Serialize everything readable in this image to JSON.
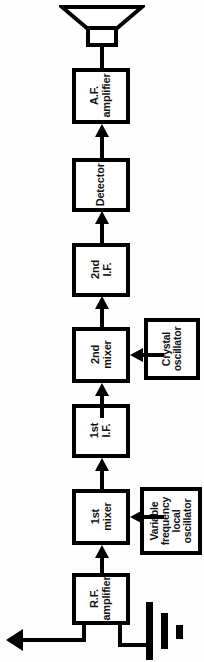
{
  "diagram": {
    "orientation": "rotated-90-ccw",
    "signal_flow": "antenna -> R.F. amplifier -> 1st mixer -> 1st I.F. -> 2nd mixer -> 2nd I.F. -> Detector -> A.F. amplifier -> loudspeaker",
    "colors": {
      "line": "#000000",
      "background": "#ffffff",
      "box_fill": "#ffffff"
    },
    "blocks": [
      {
        "id": "af-amplifier",
        "label": "A.F.\namplifier"
      },
      {
        "id": "detector",
        "label": "Detector"
      },
      {
        "id": "second-if",
        "label": "2nd\nI.F."
      },
      {
        "id": "second-mixer",
        "label": "2nd\nmixer"
      },
      {
        "id": "crystal-oscillator",
        "label": "Crystal\noscillator"
      },
      {
        "id": "first-if",
        "label": "1st\nI.F."
      },
      {
        "id": "first-mixer",
        "label": "1st\nmixer"
      },
      {
        "id": "vfo",
        "label": "Variable\nfrequency\nlocal\noscillator"
      },
      {
        "id": "rf-amplifier",
        "label": "R.F.\namplifier"
      }
    ],
    "symbols": [
      {
        "id": "loudspeaker",
        "name": "loudspeaker-symbol"
      },
      {
        "id": "antenna",
        "name": "antenna-symbol"
      },
      {
        "id": "ground",
        "name": "ground-symbol"
      }
    ]
  }
}
